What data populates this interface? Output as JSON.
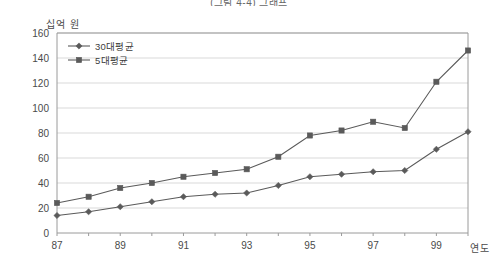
{
  "chart_data": {
    "type": "line",
    "title": "(그림 4-4) 그래프",
    "xlabel": "연도",
    "ylabel": "십억 원",
    "x": [
      87,
      88,
      89,
      90,
      91,
      92,
      93,
      94,
      95,
      96,
      97,
      98,
      99,
      100
    ],
    "tick_labels": [
      "87",
      "",
      "89",
      "",
      "91",
      "",
      "93",
      "",
      "95",
      "",
      "97",
      "",
      "99",
      ""
    ],
    "xtick_labels_shown": [
      "87",
      "89",
      "91",
      "93",
      "95",
      "97",
      "99"
    ],
    "ylim": [
      0,
      160
    ],
    "yticks": [
      0,
      20,
      40,
      60,
      80,
      100,
      120,
      140,
      160
    ],
    "grid": true,
    "legend_position": "top-left",
    "series": [
      {
        "name": "30대평균",
        "marker": "diamond",
        "color": "#5a5a5a",
        "values": [
          14,
          17,
          21,
          25,
          29,
          31,
          32,
          38,
          45,
          47,
          49,
          50,
          67,
          81
        ]
      },
      {
        "name": "5대평균",
        "marker": "square",
        "color": "#5a5a5a",
        "values": [
          24,
          29,
          36,
          40,
          45,
          48,
          51,
          61,
          78,
          82,
          89,
          84,
          121,
          146
        ]
      }
    ]
  },
  "legend": {
    "items": [
      {
        "label": "30대평균"
      },
      {
        "label": "5대평균"
      }
    ]
  },
  "axes": {
    "y_unit_label": "십억 원",
    "x_unit_label": "연도"
  },
  "colors": {
    "line": "#5a5a5a",
    "grid": "#d9d9d9",
    "axis": "#9a9a9a",
    "text": "#4a4a4a"
  }
}
